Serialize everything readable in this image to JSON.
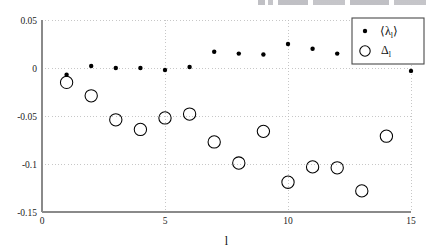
{
  "figure": {
    "background_color": "#ffffff",
    "partial_header_text": "",
    "axis_color": "#8a8a8a",
    "grid_color": "#b9b9b9",
    "marker_color": "#000000"
  },
  "legend": {
    "position": "top-right",
    "entries": [
      {
        "marker": "filled-dot",
        "label": "⟨λ",
        "sub": "l",
        "label_end": "⟩"
      },
      {
        "marker": "open-circle",
        "label": "Δ",
        "sub": "l",
        "label_end": ""
      }
    ],
    "series1_symbol": "⟨λₗ⟩",
    "series2_symbol": "Δₗ"
  },
  "chart_data": {
    "type": "scatter",
    "title": "",
    "subtitle": "",
    "xlabel": "l",
    "ylabel": "",
    "xlim": [
      0,
      15
    ],
    "ylim": [
      -0.15,
      0.05
    ],
    "xticks": [
      0,
      5,
      10,
      15
    ],
    "xtick_labels": [
      "0",
      "5",
      "10",
      "15"
    ],
    "yticks": [
      0.05,
      0,
      -0.05,
      -0.1,
      -0.15
    ],
    "ytick_labels": [
      "0.05",
      "0",
      "-0.05",
      "-0.1",
      "-0.15"
    ],
    "grid": true,
    "grid_style": "dotted",
    "legend_position": "upper right",
    "x": [
      1,
      2,
      3,
      4,
      5,
      6,
      7,
      8,
      9,
      10,
      11,
      12,
      13,
      14,
      15
    ],
    "series": [
      {
        "name": "⟨λₗ⟩",
        "marker": "filled-dot",
        "marker_size": 3.2,
        "x": [
          1,
          2,
          3,
          4,
          5,
          6,
          7,
          8,
          9,
          10,
          11,
          12,
          15
        ],
        "values": [
          -0.007,
          0.002,
          0.0,
          0.0,
          -0.002,
          0.001,
          0.017,
          0.015,
          0.014,
          0.025,
          0.02,
          0.015,
          -0.003
        ]
      },
      {
        "name": "Δₗ",
        "marker": "open-circle",
        "marker_size": 8.0,
        "x": [
          1,
          2,
          3,
          4,
          5,
          6,
          7,
          8,
          9,
          10,
          11,
          12,
          13,
          14,
          15
        ],
        "values": [
          -0.015,
          -0.029,
          -0.054,
          -0.064,
          -0.052,
          -0.048,
          -0.077,
          -0.099,
          -0.066,
          -0.119,
          -0.103,
          -0.104,
          -0.128,
          -0.071,
          0.015
        ]
      }
    ]
  }
}
